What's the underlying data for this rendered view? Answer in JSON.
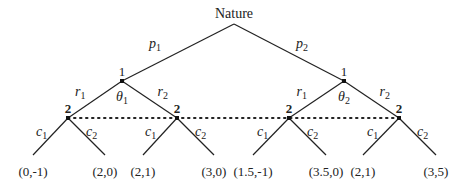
{
  "root": {
    "label": "Nature",
    "x": 234,
    "y": 24
  },
  "nature_moves": [
    {
      "label": "p",
      "sub": "1",
      "lx": 149,
      "ly": 48
    },
    {
      "label": "p",
      "sub": "2",
      "lx": 296,
      "ly": 48
    }
  ],
  "player1_nodes": [
    {
      "id": "L",
      "player": "1",
      "type": "θ",
      "type_sub": "1",
      "x": 122,
      "y": 81
    },
    {
      "id": "R",
      "player": "1",
      "type": "θ",
      "type_sub": "2",
      "x": 344,
      "y": 81
    }
  ],
  "player1_moves": [
    {
      "label": "r",
      "sub": "1"
    },
    {
      "label": "r",
      "sub": "2"
    }
  ],
  "player2_nodes": [
    {
      "player": "2",
      "x": 68,
      "y": 118
    },
    {
      "player": "2",
      "x": 177,
      "y": 118
    },
    {
      "player": "2",
      "x": 289,
      "y": 118
    },
    {
      "player": "2",
      "x": 399,
      "y": 118
    }
  ],
  "player2_moves": [
    {
      "label": "c",
      "sub": "1"
    },
    {
      "label": "c",
      "sub": "2"
    }
  ],
  "payoffs": [
    {
      "text": "(0,-1)",
      "x": 33,
      "y": 155
    },
    {
      "text": "(2,0)",
      "x": 105,
      "y": 155
    },
    {
      "text": "(2,1)",
      "x": 143,
      "y": 155
    },
    {
      "text": "(3,0)",
      "x": 214,
      "y": 155
    },
    {
      "text": "(1.5,-1)",
      "x": 253,
      "y": 155
    },
    {
      "text": "(3.5,0)",
      "x": 326,
      "y": 155
    },
    {
      "text": "(2,1)",
      "x": 363,
      "y": 155
    },
    {
      "text": "(3,5)",
      "x": 436,
      "y": 155
    }
  ],
  "information_set": {
    "style": "dotted",
    "y": 118,
    "x_start": 68,
    "x_end": 399
  },
  "colors": {
    "line": "#222222",
    "text": "#222222",
    "background": "#ffffff"
  }
}
